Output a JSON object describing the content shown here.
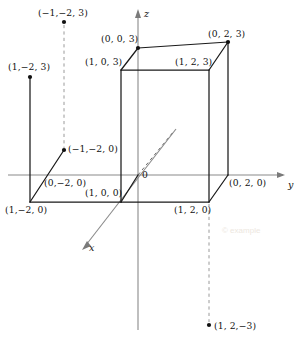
{
  "figure": {
    "width": 301,
    "height": 337,
    "background_color": "#ffffff",
    "stroke_color": "#1a1a1a",
    "axis_color": "#8a8a8a",
    "dashed_color": "#9a9a9a"
  },
  "axes": [
    {
      "name": "x-axis",
      "label": "x",
      "label_x": 89,
      "label_y": 243,
      "x1": 83,
      "y1": 248,
      "x2": 176,
      "y2": 129,
      "arrow_at": "start"
    },
    {
      "name": "y-axis",
      "label": "y",
      "label_x": 288,
      "label_y": 180,
      "x1": 8,
      "y1": 175,
      "x2": 285,
      "y2": 175,
      "arrow_at": "end"
    },
    {
      "name": "z-axis",
      "label": "z",
      "label_x": 144,
      "label_y": 9,
      "x1": 138,
      "y1": 10,
      "x2": 138,
      "y2": 330,
      "arrow_at": "start"
    }
  ],
  "origin": {
    "label": "0",
    "x": 142,
    "y": 170,
    "point_x": 138,
    "point_y": 175
  },
  "points": [
    {
      "id": "p-m1-m2-3",
      "label": "(−1,−2, 3)",
      "x": 64,
      "y": 22,
      "label_x": 38,
      "label_y": 8,
      "dot": true
    },
    {
      "id": "p-1-m2-3",
      "label": "(1,−2, 3)",
      "x": 30,
      "y": 77,
      "label_x": 8,
      "label_y": 62,
      "dot": true
    },
    {
      "id": "p-0-0-3",
      "label": "(0, 0, 3)",
      "x": 138,
      "y": 48,
      "label_x": 101,
      "label_y": 34,
      "dot": true
    },
    {
      "id": "p-1-0-3",
      "label": "(1, 0, 3)",
      "x": 121,
      "y": 70,
      "label_x": 85,
      "label_y": 57,
      "dot": false
    },
    {
      "id": "p-1-2-3",
      "label": "(1, 2, 3)",
      "x": 209,
      "y": 70,
      "label_x": 175,
      "label_y": 57,
      "dot": false
    },
    {
      "id": "p-0-2-3",
      "label": "(0, 2, 3)",
      "x": 228,
      "y": 42,
      "label_x": 208,
      "label_y": 29,
      "dot": true
    },
    {
      "id": "p-m1-m2-0",
      "label": "(−1,−2, 0)",
      "x": 64,
      "y": 150,
      "label_x": 68,
      "label_y": 144,
      "dot": true
    },
    {
      "id": "p-0-m2-0",
      "label": "(0,−2, 0)",
      "x": 46,
      "y": 175,
      "label_x": 44,
      "label_y": 178,
      "dot": false
    },
    {
      "id": "p-1-m2-0",
      "label": "(1,−2, 0)",
      "x": 30,
      "y": 202,
      "label_x": 5,
      "label_y": 205,
      "dot": false
    },
    {
      "id": "p-1-0-0",
      "label": "(1, 0, 0)",
      "x": 121,
      "y": 202,
      "label_x": 85,
      "label_y": 188,
      "dot": false
    },
    {
      "id": "p-1-2-0",
      "label": "(1, 2, 0)",
      "x": 209,
      "y": 202,
      "label_x": 174,
      "label_y": 205,
      "dot": false
    },
    {
      "id": "p-0-2-0",
      "label": "(0, 2, 0)",
      "x": 228,
      "y": 175,
      "label_x": 229,
      "label_y": 178,
      "dot": false
    },
    {
      "id": "p-1-2-m3",
      "label": "(1, 2,−3)",
      "x": 209,
      "y": 325,
      "label_x": 214,
      "label_y": 321,
      "dot": true
    }
  ],
  "solid_edges": [
    {
      "name": "edge-top-front",
      "x1": 121,
      "y1": 70,
      "x2": 209,
      "y2": 70
    },
    {
      "name": "edge-top-left-diagonal",
      "x1": 121,
      "y1": 70,
      "x2": 138,
      "y2": 48
    },
    {
      "name": "edge-top-right-diagonal",
      "x1": 209,
      "y1": 70,
      "x2": 228,
      "y2": 42
    },
    {
      "name": "edge-top-back",
      "x1": 138,
      "y1": 48,
      "x2": 228,
      "y2": 42
    },
    {
      "name": "edge-vert-front-left",
      "x1": 121,
      "y1": 70,
      "x2": 121,
      "y2": 202
    },
    {
      "name": "edge-vert-front-right",
      "x1": 209,
      "y1": 70,
      "x2": 209,
      "y2": 202
    },
    {
      "name": "edge-vert-back-right",
      "x1": 228,
      "y1": 42,
      "x2": 228,
      "y2": 175
    },
    {
      "name": "edge-bottom-front",
      "x1": 121,
      "y1": 202,
      "x2": 209,
      "y2": 202
    },
    {
      "name": "edge-bottom-left-diagonal",
      "x1": 121,
      "y1": 202,
      "x2": 138,
      "y2": 175
    },
    {
      "name": "edge-bottom-right-diagonal",
      "x1": 209,
      "y1": 202,
      "x2": 228,
      "y2": 175
    },
    {
      "name": "edge-left-wing-top",
      "x1": 30,
      "y1": 77,
      "x2": 30,
      "y2": 202
    },
    {
      "name": "edge-left-wing-bottom",
      "x1": 30,
      "y1": 202,
      "x2": 121,
      "y2": 202
    },
    {
      "name": "edge-left-wing-diagonal",
      "x1": 30,
      "y1": 202,
      "x2": 64,
      "y2": 150
    }
  ],
  "dashed_edges": [
    {
      "name": "dash-negative-x-ray",
      "x1": 138,
      "y1": 175,
      "x2": 174,
      "y2": 131
    },
    {
      "name": "dash-m1-m2-vertical",
      "x1": 64,
      "y1": 25,
      "x2": 64,
      "y2": 150
    },
    {
      "name": "dash-1-2-neg3-vertical",
      "x1": 209,
      "y1": 204,
      "x2": 209,
      "y2": 323
    }
  ],
  "watermark": {
    "text": "© example",
    "x": 222,
    "y": 226
  }
}
